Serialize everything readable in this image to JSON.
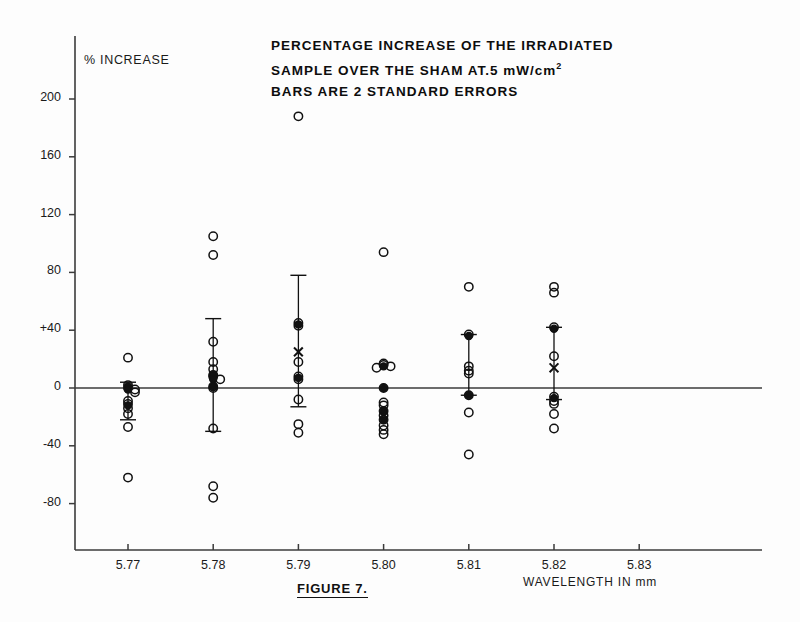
{
  "title": {
    "line1": "PERCENTAGE INCREASE OF THE IRRADIATED",
    "line2_main": "SAMPLE OVER THE SHAM AT.5 mW/cm",
    "line2_sup": "2",
    "line3": "BARS ARE 2 STANDARD ERRORS"
  },
  "caption": "FIGURE 7.",
  "chart_data": {
    "type": "scatter",
    "title": "PERCENTAGE INCREASE OF THE IRRADIATED SAMPLE OVER THE SHAM AT.5 mW/cm2  BARS ARE 2 STANDARD ERRORS",
    "xlabel": "WAVELENGTH IN mm",
    "ylabel": "% INCREASE",
    "grid": false,
    "legend": "none",
    "xlim": [
      5.765,
      5.838
    ],
    "ylim": [
      -105,
      215
    ],
    "xticks": [
      "5.77",
      "5.78",
      "5.79",
      "5.80",
      "5.81",
      "5.82",
      "5.83"
    ],
    "xtick_values": [
      5.77,
      5.78,
      5.79,
      5.8,
      5.81,
      5.82,
      5.83
    ],
    "yticks": [
      "200",
      "160",
      "120",
      "80",
      "+40",
      "0",
      "-40",
      "-80"
    ],
    "ytick_values": [
      200,
      160,
      120,
      80,
      40,
      0,
      -40,
      -80
    ],
    "zero_line": 0,
    "series": [
      {
        "name": "5.77",
        "x": 5.77,
        "points": [
          21,
          2,
          0,
          -1,
          -3,
          -9,
          -11,
          -14,
          -18,
          -27,
          -62
        ],
        "filled_points": [
          1,
          -1,
          -12
        ],
        "mean": -6,
        "error_bar": {
          "low": -22,
          "high": 4
        }
      },
      {
        "name": "5.78",
        "x": 5.78,
        "points": [
          105,
          92,
          32,
          18,
          13,
          9,
          8,
          6,
          1,
          0,
          -28,
          -68,
          -76
        ],
        "filled_points": [
          9,
          6,
          1
        ],
        "mean": 6,
        "error_bar": {
          "low": -30,
          "high": 48
        }
      },
      {
        "name": "5.79",
        "x": 5.79,
        "points": [
          188,
          45,
          43,
          18,
          8,
          6,
          -8,
          -25,
          -31
        ],
        "filled_points": [
          44,
          7
        ],
        "x_marker": 25,
        "mean": 7,
        "error_bar": {
          "low": -13,
          "high": 78
        }
      },
      {
        "name": "5.80",
        "x": 5.8,
        "points": [
          94,
          17,
          16,
          15,
          14,
          0,
          -10,
          -12,
          -16,
          -19,
          -22,
          -26,
          -29,
          -32
        ],
        "filled_points": [
          15,
          0,
          -16,
          -22
        ],
        "mean": 0,
        "error_bar": {
          "low": 0,
          "high": 0
        }
      },
      {
        "name": "5.81",
        "x": 5.81,
        "points": [
          70,
          37,
          15,
          12,
          10,
          -5,
          -17,
          -46
        ],
        "filled_points": [
          36,
          -5
        ],
        "mean": 12,
        "error_bar": {
          "low": -5,
          "high": 37
        }
      },
      {
        "name": "5.82",
        "x": 5.82,
        "points": [
          70,
          66,
          42,
          22,
          -6,
          -9,
          -11,
          -18,
          -28
        ],
        "filled_points": [
          41,
          -7
        ],
        "x_marker": 14,
        "mean": 14,
        "error_bar": {
          "low": -8,
          "high": 42
        }
      }
    ]
  },
  "colors": {
    "axis": "#3b3b3b",
    "marker": "#111111",
    "text": "#1a1a1a",
    "background": "#fdfdfd"
  }
}
